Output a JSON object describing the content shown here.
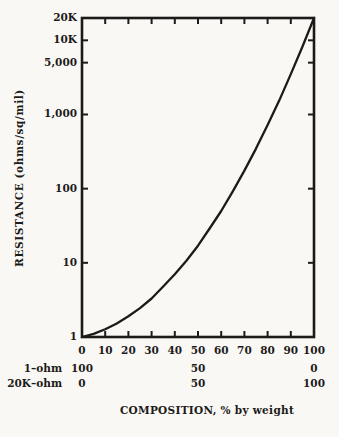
{
  "chart_data": {
    "type": "line",
    "title": "",
    "xlabel": "COMPOSITION, % by weight",
    "ylabel": "RESISTANCE (ohms/sq/mil)",
    "x_axis": {
      "min": 0,
      "max": 100,
      "ticks": [
        0,
        10,
        20,
        30,
        40,
        50,
        60,
        70,
        80,
        90,
        100
      ]
    },
    "y_axis": {
      "scale": "log",
      "min": 1,
      "max": 20000,
      "tick_labels": [
        {
          "label": "20K",
          "value": 20000
        },
        {
          "label": "10K",
          "value": 10000
        },
        {
          "label": "5,000",
          "value": 5000
        },
        {
          "label": "1,000",
          "value": 1000
        },
        {
          "label": "100",
          "value": 100
        },
        {
          "label": "10",
          "value": 10
        },
        {
          "label": "1",
          "value": 1
        }
      ]
    },
    "series": [
      {
        "name": "resistance-vs-composition",
        "points": [
          [
            0,
            1
          ],
          [
            5,
            1.1
          ],
          [
            10,
            1.27
          ],
          [
            15,
            1.52
          ],
          [
            20,
            1.9
          ],
          [
            25,
            2.45
          ],
          [
            30,
            3.3
          ],
          [
            35,
            4.8
          ],
          [
            40,
            7.0
          ],
          [
            45,
            10.7
          ],
          [
            50,
            17
          ],
          [
            55,
            29
          ],
          [
            60,
            50
          ],
          [
            65,
            92
          ],
          [
            70,
            175
          ],
          [
            75,
            347
          ],
          [
            80,
            720
          ],
          [
            85,
            1540
          ],
          [
            90,
            3500
          ],
          [
            95,
            8200
          ],
          [
            100,
            20000
          ]
        ]
      }
    ],
    "composition_rows": [
      {
        "label": "1–ohm",
        "values": [
          {
            "x": 0,
            "text": "100"
          },
          {
            "x": 50,
            "text": "50"
          },
          {
            "x": 100,
            "text": "0"
          }
        ]
      },
      {
        "label": "20K–ohm",
        "values": [
          {
            "x": 0,
            "text": "0"
          },
          {
            "x": 50,
            "text": "50"
          },
          {
            "x": 100,
            "text": "100"
          }
        ]
      }
    ],
    "legend": null,
    "grid": false,
    "colors": {
      "ink": "#1d1b19",
      "paper": "#f9f8f5"
    }
  }
}
